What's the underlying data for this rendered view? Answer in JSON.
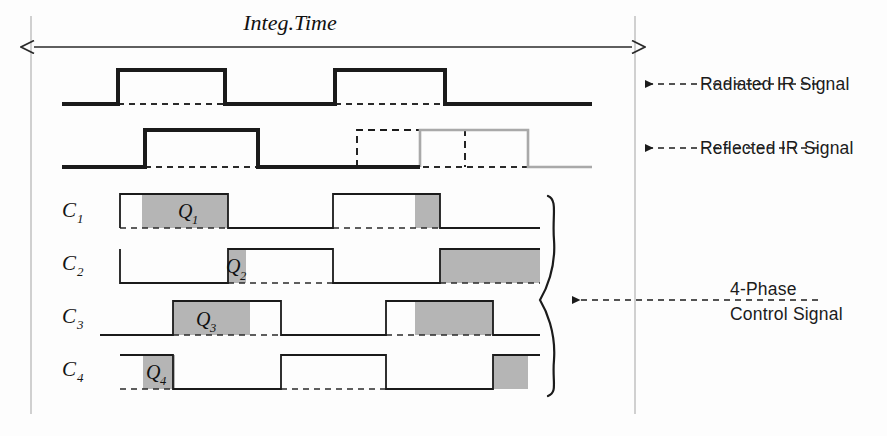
{
  "figure": {
    "background_color": "#fdfdfd",
    "stroke_color": "#1b1b1b",
    "gray_fill_color": "#b3b3b3",
    "gray_stroke_color": "#9a9a9a",
    "axis_line_color": "#b9b9b9"
  },
  "integ_time": {
    "label": "Integ.Time",
    "arrow_left_x": 31,
    "arrow_right_x": 635,
    "arrow_y": 47,
    "double_headed": true
  },
  "signal_labels": [
    {
      "id": "radiated",
      "text": "Radiated IR Signal",
      "x": 700,
      "y": 84,
      "arrow_from_x": 818,
      "arrow_to_x": 643,
      "arrow_y": 84
    },
    {
      "id": "reflected",
      "text": "Reflected IR Signal",
      "x": 700,
      "y": 148,
      "arrow_from_x": 818,
      "arrow_to_x": 643,
      "arrow_y": 148
    },
    {
      "id": "control",
      "text_line_1": "4-Phase",
      "text_line_2": "Control Signal",
      "x": 730,
      "y": 300,
      "arrow_from_x": 818,
      "arrow_to_x": 570,
      "arrow_y": 300
    }
  ],
  "waveforms": [
    {
      "id": "radiated-ir-signal",
      "name": "Radiated IR Signal",
      "baseline_y": 104,
      "high_y": 70,
      "style": "solid-thick",
      "x_start": 62,
      "x_end": 592,
      "pulses": [
        {
          "rise": 118,
          "fall": 225
        },
        {
          "rise": 335,
          "fall": 445
        }
      ],
      "dashed_baseline_segments": [
        [
          118,
          225
        ],
        [
          335,
          445
        ]
      ]
    },
    {
      "id": "reflected-ir-signal",
      "name": "Reflected IR Signal",
      "baseline_y": 167,
      "high_y": 130,
      "style": "solid-thick",
      "x_start": 62,
      "x_end": 592,
      "black_pulses": [
        {
          "rise": 145,
          "fall": 258
        }
      ],
      "dashed_pulses": [
        {
          "rise": 357,
          "fall": 465
        }
      ],
      "gray_pulses": [
        {
          "rise": 420,
          "fall": 528
        }
      ],
      "black_baseline_end": 420,
      "gray_baseline_start": 528,
      "dashed_baseline_segments": [
        [
          145,
          258
        ],
        [
          357,
          528
        ]
      ]
    }
  ],
  "control_signals": [
    {
      "id": "c1",
      "label": "C",
      "subscript": "1",
      "charge_label": "Q",
      "charge_subscript": "1",
      "label_x": 62,
      "label_y": 217,
      "baseline_y": 228,
      "high_y": 194,
      "start_level": "low",
      "x_start": 120,
      "x_end": 540,
      "edges": [
        120,
        228,
        333,
        440
      ],
      "gray_regions": [
        [
          142,
          228
        ],
        [
          415,
          440
        ]
      ],
      "charge_label_x": 178,
      "charge_label_y": 218,
      "dashed_baseline_segments": [
        [
          120,
          228
        ],
        [
          333,
          440
        ]
      ]
    },
    {
      "id": "c2",
      "label": "C",
      "subscript": "2",
      "charge_label": "Q",
      "charge_subscript": "2",
      "label_x": 62,
      "label_y": 270,
      "baseline_y": 283,
      "high_y": 249,
      "start_level": "high",
      "x_start": 120,
      "x_end": 540,
      "edges": [
        120,
        228,
        333,
        440
      ],
      "gray_regions": [
        [
          228,
          245
        ],
        [
          440,
          540
        ]
      ],
      "charge_label_x": 240,
      "charge_label_y": 275,
      "dashed_baseline_segments": [
        [
          228,
          333
        ],
        [
          440,
          540
        ]
      ]
    },
    {
      "id": "c3",
      "label": "C",
      "subscript": "3",
      "charge_label": "Q",
      "charge_subscript": "3",
      "label_x": 62,
      "label_y": 323,
      "baseline_y": 335,
      "high_y": 301,
      "start_level": "low",
      "x_start": 100,
      "x_end": 540,
      "edges": [
        173,
        281,
        386,
        493
      ],
      "gray_regions": [
        [
          173,
          250
        ],
        [
          415,
          493
        ]
      ],
      "charge_label_x": 196,
      "charge_label_y": 326,
      "dashed_baseline_segments": [
        [
          173,
          281
        ],
        [
          386,
          493
        ]
      ]
    },
    {
      "id": "c4",
      "label": "C",
      "subscript": "4",
      "charge_label": "Q",
      "charge_subscript": "4",
      "label_x": 62,
      "label_y": 376,
      "baseline_y": 389,
      "high_y": 355,
      "start_level": "high",
      "x_start": 120,
      "x_end": 540,
      "edges": [
        173,
        281,
        386,
        493
      ],
      "gray_regions": [
        [
          143,
          175
        ],
        [
          493,
          528
        ]
      ],
      "charge_label_x": 150,
      "charge_label_y": 380,
      "dashed_baseline_segments": [
        [
          120,
          173
        ],
        [
          281,
          386
        ]
      ]
    }
  ],
  "brace": {
    "id": "control-signal-brace",
    "x": 556,
    "top_y": 196,
    "bottom_y": 396,
    "tip_y": 300,
    "orientation": "right-facing"
  },
  "guide_lines": {
    "left_vertical_x": 31,
    "left_vertical_top": 16,
    "left_vertical_bottom": 414,
    "right_vertical_x": 635,
    "right_vertical_top": 16,
    "right_vertical_bottom": 414
  }
}
